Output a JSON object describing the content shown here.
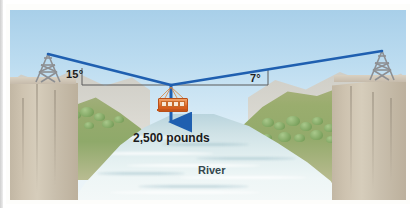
{
  "figure": {
    "type": "physics-diagram",
    "labels": {
      "angle_left": "15°",
      "angle_right": "7°",
      "weight": "2,500 pounds",
      "river": "River"
    },
    "elements": {
      "left_tower": "left-cable-tower",
      "right_tower": "right-cable-tower",
      "cable_car": "cable-car-gondola",
      "weight_arrow": "downward-force-arrow",
      "horizontal_reference": "horizontal-dashed-reference-line",
      "left_cliff": "left-canyon-cliff",
      "right_cliff": "right-canyon-cliff",
      "river_body": "river-water"
    },
    "colors": {
      "cable": "#1f5fb0",
      "arrow": "#1f5fb0",
      "reference_line": "#5a5a5a",
      "sky_top": "#a8cfe9",
      "sky_bottom": "#eef6f9",
      "cliff": "#cec3b0",
      "hill": "#93aa6b",
      "water": "#dcecef",
      "gondola": "#e0731f",
      "tower": "#8d8f92",
      "text": "#1d1d1d"
    },
    "geometry": {
      "left_anchor": {
        "x": 38,
        "y": 44
      },
      "right_anchor": {
        "x": 372,
        "y": 41
      },
      "junction": {
        "x": 161,
        "y": 75
      },
      "arrow_tip": {
        "x": 161,
        "y": 119
      },
      "left_angle_deg": 15,
      "right_angle_deg": 7
    }
  }
}
